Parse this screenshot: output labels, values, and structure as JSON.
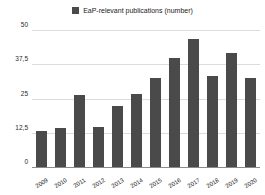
{
  "chart_data": {
    "type": "bar",
    "title": "",
    "xlabel": "",
    "ylabel": "",
    "ylim": [
      0,
      50
    ],
    "yticks": [
      0,
      12.5,
      25,
      37.5,
      50
    ],
    "ytick_labels": [
      "0",
      "12,5",
      "25",
      "37,5",
      "50"
    ],
    "grid": true,
    "legend_position": "top-center",
    "legend": [
      "EaP-relevant publications (number)"
    ],
    "series_color": "#4a4a4a",
    "categories": [
      "2009",
      "2010",
      "2011",
      "2012",
      "2013",
      "2014",
      "2015",
      "2016",
      "2017",
      "2018",
      "2019",
      "2020"
    ],
    "series": [
      {
        "name": "EaP-relevant publications (number)",
        "values": [
          13.5,
          14.5,
          26.5,
          15,
          22.5,
          27,
          33,
          40,
          47,
          33.5,
          42,
          33
        ]
      }
    ]
  },
  "legend": {
    "swatch_color": "#4a4a4a",
    "label": "EaP-relevant publications (number)"
  },
  "axes": {
    "y_tick_labels": [
      "50",
      "37,5",
      "25",
      "12,5",
      "0"
    ],
    "x_tick_labels": [
      "2009",
      "2010",
      "2011",
      "2012",
      "2013",
      "2014",
      "2015",
      "2016",
      "2017",
      "2018",
      "2019",
      "2020"
    ]
  }
}
